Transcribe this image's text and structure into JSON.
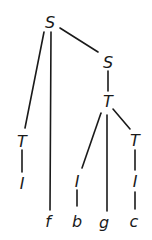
{
  "diagram": {
    "type": "parse-tree",
    "nodes": [
      {
        "id": "n0",
        "label": "S",
        "x": 50,
        "y": 22
      },
      {
        "id": "n1",
        "label": "T",
        "x": 22,
        "y": 141
      },
      {
        "id": "n2",
        "label": "I",
        "x": 22,
        "y": 183
      },
      {
        "id": "n3",
        "label": "f",
        "x": 48,
        "y": 221
      },
      {
        "id": "n4",
        "label": "S",
        "x": 108,
        "y": 62
      },
      {
        "id": "n5",
        "label": "T",
        "x": 108,
        "y": 101
      },
      {
        "id": "n6",
        "label": "I",
        "x": 77,
        "y": 181
      },
      {
        "id": "n7",
        "label": "b",
        "x": 77,
        "y": 221
      },
      {
        "id": "n8",
        "label": "g",
        "x": 104,
        "y": 222
      },
      {
        "id": "n9",
        "label": "T",
        "x": 135,
        "y": 140
      },
      {
        "id": "n10",
        "label": "I",
        "x": 135,
        "y": 181
      },
      {
        "id": "n11",
        "label": "c",
        "x": 134,
        "y": 221
      }
    ],
    "edges": [
      {
        "from": "n0",
        "to": "n1",
        "x1": 44,
        "y1": 32,
        "x2": 25,
        "y2": 128
      },
      {
        "from": "n0",
        "to": "n3",
        "x1": 51,
        "y1": 32,
        "x2": 50,
        "y2": 210
      },
      {
        "from": "n0",
        "to": "n4",
        "x1": 60,
        "y1": 28,
        "x2": 98,
        "y2": 52
      },
      {
        "from": "n1",
        "to": "n2",
        "x1": 22,
        "y1": 150,
        "x2": 22,
        "y2": 172
      },
      {
        "from": "n4",
        "to": "n5",
        "x1": 108,
        "y1": 71,
        "x2": 108,
        "y2": 91
      },
      {
        "from": "n5",
        "to": "n6",
        "x1": 101,
        "y1": 113,
        "x2": 82,
        "y2": 168
      },
      {
        "from": "n5",
        "to": "n8",
        "x1": 107,
        "y1": 115,
        "x2": 107,
        "y2": 211
      },
      {
        "from": "n5",
        "to": "n9",
        "x1": 113,
        "y1": 109,
        "x2": 130,
        "y2": 129
      },
      {
        "from": "n6",
        "to": "n7",
        "x1": 77,
        "y1": 190,
        "x2": 77,
        "y2": 206
      },
      {
        "from": "n9",
        "to": "n10",
        "x1": 135,
        "y1": 150,
        "x2": 135,
        "y2": 170
      },
      {
        "from": "n10",
        "to": "n11",
        "x1": 135,
        "y1": 192,
        "x2": 135,
        "y2": 209
      }
    ],
    "colors": {
      "ink": "#1a1a1a",
      "background": "#ffffff"
    }
  }
}
